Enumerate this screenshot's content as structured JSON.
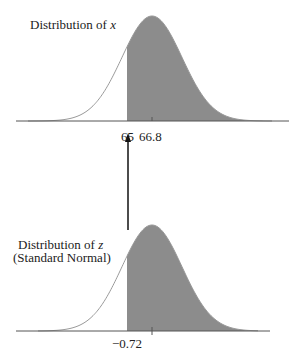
{
  "top_chart": {
    "title_prefix": "Distribution of ",
    "title_var": "x",
    "mean_label": "66.8",
    "cut_label": "65"
  },
  "bottom_chart": {
    "title_prefix": "Distribution of ",
    "title_var": "z",
    "subtitle": "(Standard Normal)",
    "cut_label": "−0.72"
  },
  "colors": {
    "shade": "#8c8c8c",
    "curve": "#9a9a9a",
    "axis": "#555555",
    "arrow": "#111111"
  },
  "chart_data": [
    {
      "type": "area",
      "title": "Distribution of x",
      "distribution": "normal",
      "mean": 66.8,
      "shaded_region": {
        "from": 65,
        "to": "inf"
      },
      "tick_labels": [
        "65",
        "66.8"
      ]
    },
    {
      "type": "area",
      "title": "Distribution of z (Standard Normal)",
      "distribution": "standard normal",
      "mean": 0,
      "sd": 1,
      "shaded_region": {
        "from": -0.72,
        "to": "inf"
      },
      "tick_labels": [
        "-0.72"
      ]
    }
  ]
}
